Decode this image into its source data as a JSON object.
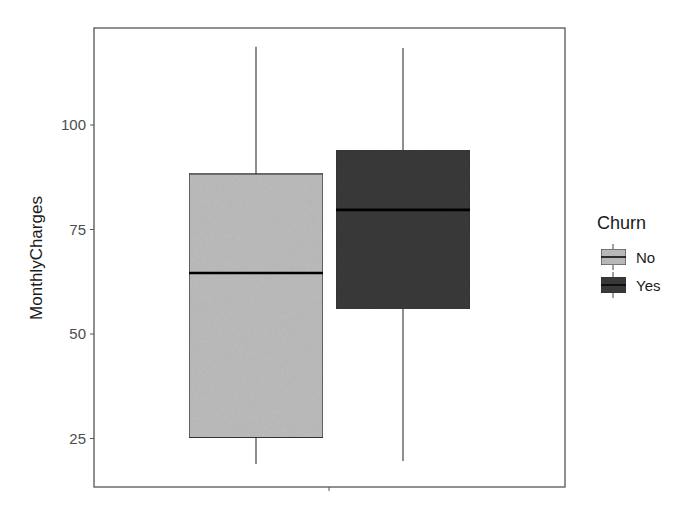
{
  "chart_data": {
    "type": "boxplot",
    "title": "",
    "xlabel": "",
    "ylabel": "MonthlyCharges",
    "ylim": [
      15,
      122
    ],
    "yticks": [
      25,
      50,
      75,
      100
    ],
    "ytick_labels": [
      "25",
      "50",
      "75",
      "100"
    ],
    "grid": false,
    "legend": {
      "title": "Churn",
      "position": "right",
      "entries": [
        {
          "label": "No",
          "color": "#bdbdbd"
        },
        {
          "label": "Yes",
          "color": "#3a3a3a"
        }
      ]
    },
    "series": [
      {
        "name": "No",
        "whisker_low": 18.9,
        "q1": 25.2,
        "median": 64.6,
        "q3": 88.3,
        "whisker_high": 118.7,
        "color": "#bdbdbd"
      },
      {
        "name": "Yes",
        "whisker_low": 19.6,
        "q1": 56.0,
        "median": 79.7,
        "q3": 94.0,
        "whisker_high": 118.4,
        "color": "#3a3a3a"
      }
    ]
  }
}
